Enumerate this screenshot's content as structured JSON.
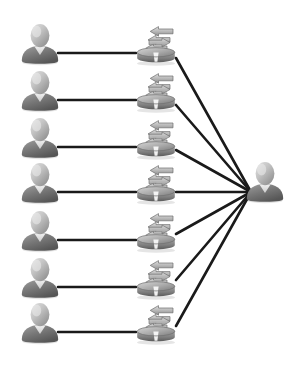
{
  "diagram": {
    "type": "network-topology",
    "canvas": {
      "width": 300,
      "height": 375,
      "background": "#ffffff"
    },
    "palette": {
      "line": "#1a1a1a",
      "user_light": "#cfcfcf",
      "user_mid": "#9a9a9a",
      "user_dark": "#5f5f5f",
      "router_light": "#c8c8c8",
      "router_mid": "#9c9c9c",
      "router_dark": "#6a6a6a"
    },
    "counts": {
      "clients": 7,
      "routers": 7,
      "servers": 1,
      "client_router_links": 7,
      "router_server_links": 7
    },
    "client_nodes": [
      {
        "id": "client-1",
        "icon": "user-icon",
        "label": "User 1",
        "x": 18,
        "y": 22,
        "w": 44,
        "h": 44,
        "anchor_x": 58,
        "anchor_y": 53
      },
      {
        "id": "client-2",
        "icon": "user-icon",
        "label": "User 2",
        "x": 18,
        "y": 69,
        "w": 44,
        "h": 44,
        "anchor_x": 58,
        "anchor_y": 100
      },
      {
        "id": "client-3",
        "icon": "user-icon",
        "label": "User 3",
        "x": 18,
        "y": 116,
        "w": 44,
        "h": 44,
        "anchor_x": 58,
        "anchor_y": 147
      },
      {
        "id": "client-4",
        "icon": "user-icon",
        "label": "User 4",
        "x": 18,
        "y": 161,
        "w": 44,
        "h": 44,
        "anchor_x": 58,
        "anchor_y": 192
      },
      {
        "id": "client-5",
        "icon": "user-icon",
        "label": "User 5",
        "x": 18,
        "y": 209,
        "w": 44,
        "h": 44,
        "anchor_x": 58,
        "anchor_y": 240
      },
      {
        "id": "client-6",
        "icon": "user-icon",
        "label": "User 6",
        "x": 18,
        "y": 256,
        "w": 44,
        "h": 44,
        "anchor_x": 58,
        "anchor_y": 287
      },
      {
        "id": "client-7",
        "icon": "user-icon",
        "label": "User 7",
        "x": 18,
        "y": 301,
        "w": 44,
        "h": 44,
        "anchor_x": 58,
        "anchor_y": 332
      }
    ],
    "router_nodes": [
      {
        "id": "router-1",
        "icon": "router-icon",
        "label": "Router 1",
        "x": 132,
        "y": 26,
        "w": 48,
        "h": 40,
        "in_x": 136,
        "in_y": 53,
        "out_x": 176,
        "out_y": 58
      },
      {
        "id": "router-2",
        "icon": "router-icon",
        "label": "Router 2",
        "x": 132,
        "y": 73,
        "w": 48,
        "h": 40,
        "in_x": 136,
        "in_y": 100,
        "out_x": 176,
        "out_y": 105
      },
      {
        "id": "router-3",
        "icon": "router-icon",
        "label": "Router 3",
        "x": 132,
        "y": 120,
        "w": 48,
        "h": 40,
        "in_x": 136,
        "in_y": 147,
        "out_x": 176,
        "out_y": 150
      },
      {
        "id": "router-4",
        "icon": "router-icon",
        "label": "Router 4",
        "x": 132,
        "y": 165,
        "w": 48,
        "h": 40,
        "in_x": 136,
        "in_y": 192,
        "out_x": 176,
        "out_y": 192
      },
      {
        "id": "router-5",
        "icon": "router-icon",
        "label": "Router 5",
        "x": 132,
        "y": 213,
        "w": 48,
        "h": 40,
        "in_x": 136,
        "in_y": 240,
        "out_x": 176,
        "out_y": 234
      },
      {
        "id": "router-6",
        "icon": "router-icon",
        "label": "Router 6",
        "x": 132,
        "y": 260,
        "w": 48,
        "h": 40,
        "in_x": 136,
        "in_y": 287,
        "out_x": 176,
        "out_y": 280
      },
      {
        "id": "router-7",
        "icon": "router-icon",
        "label": "Router 7",
        "x": 132,
        "y": 305,
        "w": 48,
        "h": 40,
        "in_x": 136,
        "in_y": 332,
        "out_x": 176,
        "out_y": 326
      }
    ],
    "server_node": {
      "id": "server-1",
      "icon": "user-icon",
      "label": "Central user",
      "x": 243,
      "y": 160,
      "w": 44,
      "h": 44,
      "anchor_x": 251,
      "anchor_y": 192
    },
    "link_style": {
      "stroke_width": 2.6,
      "color": "#1a1a1a",
      "dash": "none"
    }
  }
}
